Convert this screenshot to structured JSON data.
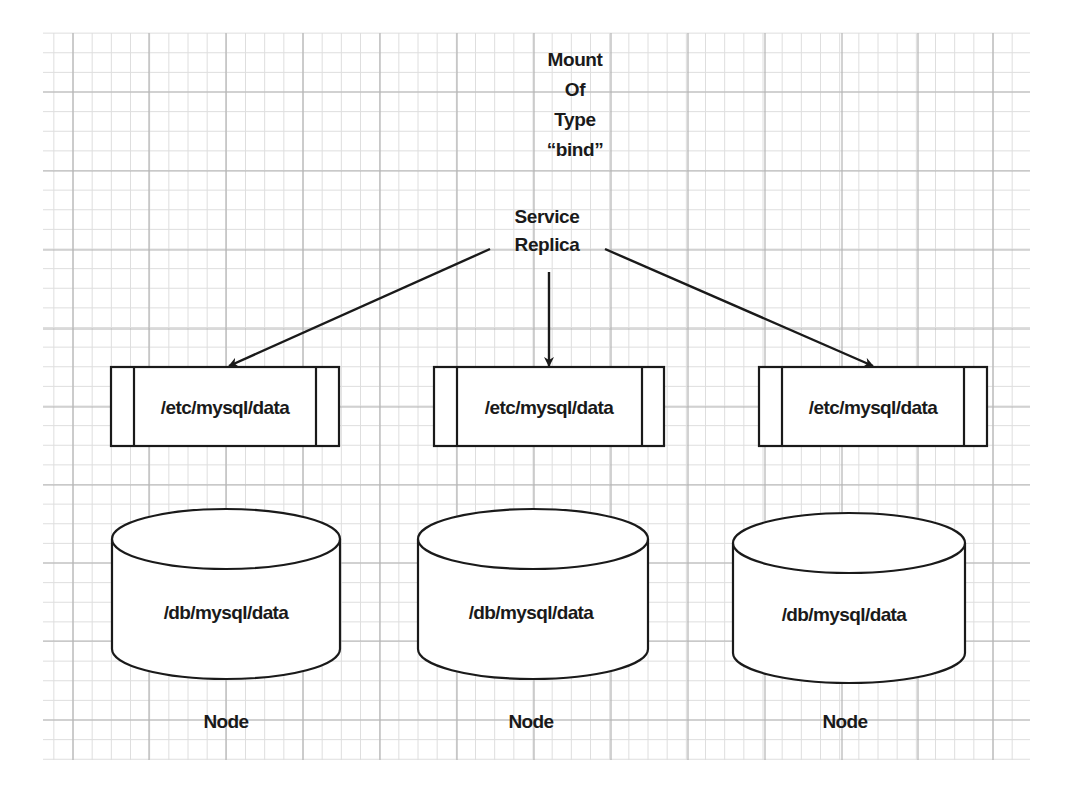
{
  "diagram": {
    "type": "architecture",
    "background": "#ffffff",
    "grid": {
      "x_start": 43,
      "x_end": 1030,
      "y_start": 33,
      "y_end": 760,
      "major_x": [
        73,
        149,
        226,
        303,
        380,
        457,
        534,
        611,
        688,
        765,
        842,
        918,
        993
      ],
      "major_y": [
        92,
        171,
        250,
        329,
        407,
        485,
        563,
        641,
        720
      ],
      "minor_subdivisions": 4,
      "major_color": "#b4b4b4",
      "minor_color": "#dedede"
    },
    "title": {
      "lines": [
        "Mount",
        "Of",
        "Type",
        "“bind”"
      ]
    },
    "source": {
      "lines": [
        "Service",
        "Replica"
      ]
    },
    "mounts": [
      {
        "label": "/etc/mysql/data"
      },
      {
        "label": "/etc/mysql/data"
      },
      {
        "label": "/etc/mysql/data"
      }
    ],
    "volumes": [
      {
        "label": "/db/mysql/data",
        "node_label": "Node"
      },
      {
        "label": "/db/mysql/data",
        "node_label": "Node"
      },
      {
        "label": "/db/mysql/data",
        "node_label": "Node"
      }
    ],
    "edges": [
      {
        "from": "service-replica",
        "to": "mount-1"
      },
      {
        "from": "service-replica",
        "to": "mount-2"
      },
      {
        "from": "service-replica",
        "to": "mount-3"
      }
    ],
    "stroke_color": "#1a1a1a"
  }
}
